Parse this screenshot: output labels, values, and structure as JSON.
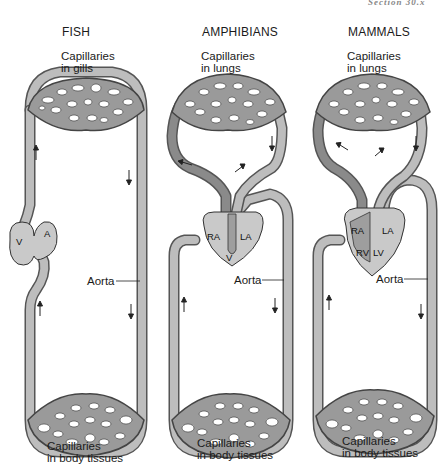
{
  "page": {
    "running_header": "Section 30.x"
  },
  "panels": [
    {
      "id": "fish",
      "title": "FISH",
      "top_capillaries": "Capillaries\nin gills",
      "top_line1": "Capillaries",
      "top_line2": "in gills",
      "heart_labels": [
        "V",
        "A"
      ],
      "aorta_label": "Aorta",
      "bottom_line1": "Capillaries",
      "bottom_line2": "in body tissues"
    },
    {
      "id": "amphibians",
      "title": "AMPHIBIANS",
      "top_line1": "Capillaries",
      "top_line2": "in lungs",
      "heart_labels": [
        "RA",
        "LA",
        "V"
      ],
      "aorta_label": "Aorta",
      "bottom_line1": "Capillaries",
      "bottom_line2": "in body tissues"
    },
    {
      "id": "mammals",
      "title": "MAMMALS",
      "top_line1": "Capillaries",
      "top_line2": "in lungs",
      "heart_labels": [
        "RA",
        "LA",
        "RV",
        "LV"
      ],
      "aorta_label": "Aorta",
      "bottom_line1": "Capillaries",
      "bottom_line2": "in body tissues"
    }
  ],
  "colors": {
    "vessel_outline": "#555555",
    "vessel_fill": "#bdbdbd",
    "deoxygenated_fill": "#8a8a8a",
    "heart_fill": "#c9c9c9"
  }
}
